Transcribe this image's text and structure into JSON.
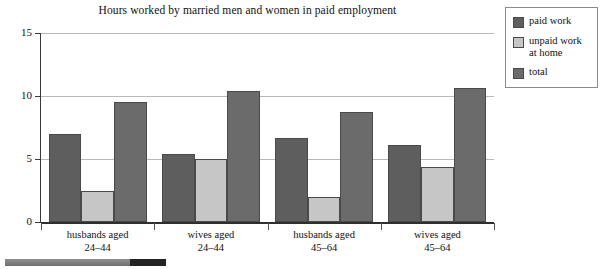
{
  "chart_data": {
    "type": "bar",
    "title": "Hours worked by married men and women in paid employment",
    "xlabel": "",
    "ylabel": "",
    "ylim": [
      0,
      15
    ],
    "yticks": [
      0,
      5,
      10,
      15
    ],
    "ytick_labels": [
      "0",
      "5",
      "10",
      "15"
    ],
    "grid": true,
    "legend_position": "right-outside",
    "categories": [
      "husbands aged 24–44",
      "wives aged 24–44",
      "husbands aged 45–64",
      "wives aged 45–64"
    ],
    "category_lines": [
      [
        "husbands aged",
        "24–44"
      ],
      [
        "wives aged",
        "24–44"
      ],
      [
        "husbands aged",
        "45–64"
      ],
      [
        "wives aged",
        "45–64"
      ]
    ],
    "series": [
      {
        "name": "paid work",
        "color": "#5e5e5e",
        "values": [
          7.0,
          5.4,
          6.7,
          6.1
        ]
      },
      {
        "name": "unpaid work at home",
        "color": "#c6c6c6",
        "values": [
          2.5,
          5.0,
          2.0,
          4.4
        ]
      },
      {
        "name": "total",
        "color": "#6b6b6b",
        "values": [
          9.5,
          10.4,
          8.7,
          10.6
        ]
      }
    ]
  },
  "legend": {
    "items": [
      {
        "label": "paid work",
        "color": "#5e5e5e"
      },
      {
        "label": "unpaid work at home",
        "color": "#c6c6c6"
      },
      {
        "label": "total",
        "color": "#6b6b6b"
      }
    ]
  },
  "scrollbar": {
    "orientation": "horizontal",
    "track_color": "#7f7f7f",
    "thumb_color": "#232323"
  }
}
